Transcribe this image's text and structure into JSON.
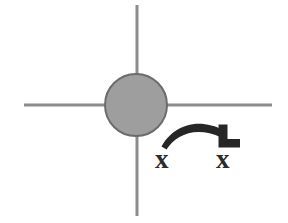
{
  "figure": {
    "background_color": "#ffffff",
    "canvas": {
      "width": 288,
      "height": 223
    }
  },
  "axes": {
    "stroke_color": "#8c8c8c",
    "stroke_width": 3,
    "horizontal": {
      "name": "horizontal axis line",
      "x1": 24,
      "y1": 105,
      "x2": 272,
      "y2": 105
    },
    "vertical": {
      "name": "vertical axis line",
      "x1": 137,
      "y1": 5,
      "x2": 137,
      "y2": 216
    }
  },
  "node": {
    "name": "center node disc",
    "cx": 136,
    "cy": 105,
    "r": 31,
    "fill_color": "#9e9e9e",
    "stroke_color": "#6b6b6b",
    "stroke_width": 2
  },
  "arrow": {
    "name": "curved motion arrow",
    "color": "#262626",
    "direction": "left-to-right",
    "arc_start": {
      "x": 162,
      "y": 145
    },
    "arc_peak": {
      "x": 196,
      "y": 122
    },
    "arc_end": {
      "x": 224,
      "y": 135
    },
    "head": {
      "name": "corner arrowhead",
      "corner": {
        "x": 231,
        "y": 144
      },
      "points_toward": "down-right"
    }
  },
  "markers": [
    {
      "id": "source",
      "name": "source position marker",
      "glyph": "x",
      "x": 168,
      "y": 159
    },
    {
      "id": "target",
      "name": "target position marker",
      "glyph": "x",
      "x": 229,
      "y": 159
    }
  ],
  "marker_labels": {
    "source": "x",
    "target": "x"
  }
}
